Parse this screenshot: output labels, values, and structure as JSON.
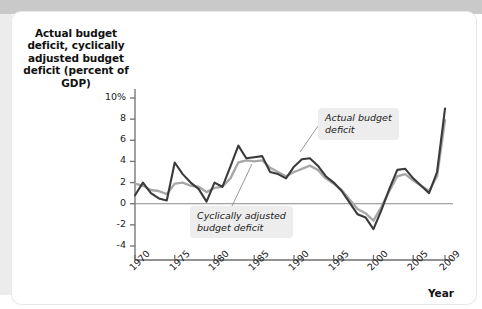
{
  "figure": {
    "y_axis_title": "Actual budget deficit, cyclically adjusted budget deficit (percent of GDP)",
    "x_axis_title": "Year",
    "annotations": {
      "actual": "Actual budget\ndeficit",
      "cyclically_adjusted": "Cyclically adjusted\nbudget deficit"
    },
    "colors": {
      "actual_line": "#3a3a3a",
      "cyclically_adjusted_line": "#a8a8a8",
      "axis": "#6e6e6e",
      "zero_line": "#8a8a8a",
      "callout_background": "#ededed",
      "page_band": "#c9c9c9"
    }
  },
  "chart_data": {
    "type": "line",
    "title": "",
    "xlabel": "Year",
    "ylabel": "Actual budget deficit, cyclically adjusted budget deficit (percent of GDP)",
    "xlim": [
      1970,
      2009
    ],
    "ylim": [
      -4,
      10
    ],
    "ytick_labels": [
      "10%",
      "8",
      "6",
      "4",
      "2",
      "0",
      "-2",
      "-4"
    ],
    "yticks": [
      10,
      8,
      6,
      4,
      2,
      0,
      -2,
      -4
    ],
    "xticks": [
      1970,
      1975,
      1980,
      1985,
      1990,
      1995,
      2000,
      2005,
      2009
    ],
    "xtick_labels": [
      "1970",
      "1975",
      "1980",
      "1985",
      "1990",
      "1995",
      "2000",
      "2005",
      "2009"
    ],
    "grid": false,
    "legend": "annotations",
    "zero_reference_line": 0,
    "x": [
      1970,
      1971,
      1972,
      1973,
      1974,
      1975,
      1976,
      1977,
      1978,
      1979,
      1980,
      1981,
      1982,
      1983,
      1984,
      1985,
      1986,
      1987,
      1988,
      1989,
      1990,
      1991,
      1992,
      1993,
      1994,
      1995,
      1996,
      1997,
      1998,
      1999,
      2000,
      2001,
      2002,
      2003,
      2004,
      2005,
      2006,
      2007,
      2008,
      2009
    ],
    "series": [
      {
        "name": "Actual budget deficit",
        "color": "#3a3a3a",
        "values": [
          0.8,
          2.0,
          1.0,
          0.5,
          0.3,
          3.9,
          2.8,
          2.0,
          1.4,
          0.2,
          2.0,
          1.6,
          3.5,
          5.5,
          4.3,
          4.4,
          4.5,
          3.0,
          2.8,
          2.4,
          3.5,
          4.2,
          4.3,
          3.6,
          2.6,
          2.0,
          1.2,
          0.1,
          -1.0,
          -1.3,
          -2.4,
          -0.6,
          1.4,
          3.2,
          3.3,
          2.4,
          1.7,
          1.0,
          3.0,
          9.0
        ]
      },
      {
        "name": "Cyclically adjusted budget deficit",
        "color": "#a8a8a8",
        "values": [
          1.9,
          1.7,
          1.3,
          1.2,
          0.9,
          1.9,
          2.0,
          1.7,
          1.6,
          1.1,
          1.5,
          1.6,
          2.4,
          3.9,
          4.1,
          4.0,
          4.1,
          3.4,
          3.0,
          2.6,
          3.0,
          3.3,
          3.6,
          3.2,
          2.4,
          1.9,
          1.3,
          0.4,
          -0.5,
          -0.9,
          -1.6,
          -0.3,
          1.2,
          2.6,
          2.8,
          2.2,
          1.7,
          1.2,
          2.6,
          7.9
        ]
      }
    ]
  }
}
